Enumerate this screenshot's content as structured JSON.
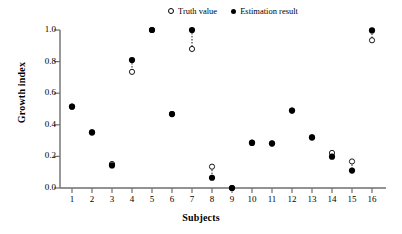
{
  "legend": {
    "entries": [
      {
        "label": "Truth value",
        "marker": "open-circle-icon"
      },
      {
        "label": "Estimation result",
        "marker": "filled-circle-icon"
      }
    ]
  },
  "axes": {
    "xlabel": "Subjects",
    "ylabel": "Growth index",
    "yticks": [
      "0.0",
      "0.2",
      "0.4",
      "0.6",
      "0.8",
      "1.0"
    ],
    "xticks": [
      "1",
      "2",
      "3",
      "4",
      "5",
      "6",
      "7",
      "8",
      "9",
      "10",
      "11",
      "12",
      "13",
      "14",
      "15",
      "16"
    ]
  },
  "chart_data": {
    "type": "scatter",
    "title": "",
    "xlabel": "Subjects",
    "ylabel": "Growth index",
    "xlim": [
      0.5,
      16.5
    ],
    "ylim": [
      0.0,
      1.0
    ],
    "grid": false,
    "legend_position": "top-center",
    "categories": [
      1,
      2,
      3,
      4,
      5,
      6,
      7,
      8,
      9,
      10,
      11,
      12,
      13,
      14,
      15,
      16
    ],
    "series": [
      {
        "name": "Truth value",
        "marker": "open-circle",
        "values": [
          0.515,
          0.352,
          0.152,
          0.735,
          1.0,
          0.468,
          0.88,
          0.135,
          0.0,
          0.288,
          0.283,
          0.49,
          0.32,
          0.222,
          0.168,
          0.935
        ]
      },
      {
        "name": "Estimation result",
        "marker": "filled-circle",
        "values": [
          0.515,
          0.352,
          0.143,
          0.81,
          1.0,
          0.468,
          1.0,
          0.065,
          0.0,
          0.285,
          0.281,
          0.49,
          0.32,
          0.198,
          0.11,
          0.997
        ]
      }
    ],
    "connectors": [
      {
        "x": 4,
        "y_from": 0.81,
        "y_to": 0.735
      },
      {
        "x": 7,
        "y_from": 1.0,
        "y_to": 0.88
      },
      {
        "x": 8,
        "y_from": 0.135,
        "y_to": 0.065
      },
      {
        "x": 14,
        "y_from": 0.222,
        "y_to": 0.198
      },
      {
        "x": 15,
        "y_from": 0.168,
        "y_to": 0.11
      },
      {
        "x": 16,
        "y_from": 0.997,
        "y_to": 0.935
      }
    ]
  }
}
